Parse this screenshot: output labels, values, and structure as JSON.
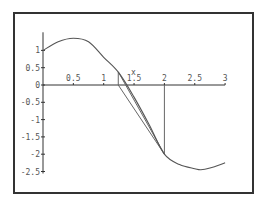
{
  "chart_data": {
    "type": "line",
    "title": "",
    "xlabel": "x",
    "ylabel": "",
    "xlim": [
      0,
      3
    ],
    "ylim": [
      -2.5,
      1.35
    ],
    "grid": false,
    "legend": null,
    "x_ticks": [
      0.5,
      1,
      1.5,
      2,
      2.5,
      3
    ],
    "x_tick_labels": [
      "0.5",
      "1",
      "1.5",
      "2",
      "2.5",
      "3"
    ],
    "y_ticks": [
      1,
      0.5,
      0,
      -0.5,
      -1,
      -1.5,
      -2,
      -2.5
    ],
    "y_tick_labels": [
      "1",
      "0.5",
      "0",
      "-0.5",
      "-1",
      "-1.5",
      "-2",
      "-2.5"
    ],
    "series": [
      {
        "name": "f(x)",
        "x": [
          0,
          0.25,
          0.5,
          0.75,
          1.0,
          1.25,
          1.5,
          1.75,
          2.0,
          2.25,
          2.5,
          2.6,
          2.75,
          3.0
        ],
        "y": [
          1.0,
          1.25,
          1.35,
          1.25,
          0.8,
          0.35,
          -0.35,
          -1.15,
          -2.0,
          -2.3,
          -2.42,
          -2.45,
          -2.4,
          -2.25
        ]
      }
    ],
    "annotations": [
      {
        "kind": "vertical-segment",
        "x": 2.0,
        "y_from": 0,
        "y_to": -2.0
      },
      {
        "kind": "tangent-segment",
        "from": [
          2.0,
          -2.0
        ],
        "to": [
          1.24,
          0
        ]
      },
      {
        "kind": "vertical-segment",
        "x": 1.24,
        "y_from": 0,
        "y_to": 0.38
      },
      {
        "kind": "tangent-segment",
        "from": [
          1.24,
          0.38
        ],
        "to": [
          2.0,
          -2.0
        ]
      }
    ]
  },
  "frame": {
    "left": 14,
    "top": 13,
    "right": 253,
    "bottom": 193
  },
  "axes": {
    "origin_px": [
      43,
      85
    ],
    "x_scale": 60.7,
    "y_scale": 34.6,
    "x_axis_label": "x"
  }
}
